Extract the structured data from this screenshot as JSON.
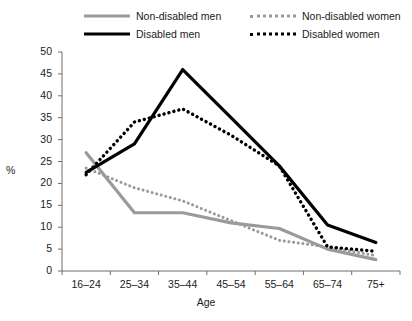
{
  "chart_data": {
    "type": "line",
    "title": "",
    "xlabel": "Age",
    "ylabel": "%",
    "categories": [
      "16–24",
      "25–34",
      "35–44",
      "45–54",
      "55–64",
      "65–74",
      "75+"
    ],
    "ylim": [
      0,
      50
    ],
    "ytick_values": [
      0,
      5,
      10,
      15,
      20,
      25,
      30,
      35,
      40,
      45,
      50
    ],
    "ytick_labels": [
      "0",
      "5",
      "10",
      "15",
      "20",
      "25",
      "30",
      "35",
      "40",
      "45",
      "50"
    ],
    "grid": false,
    "legend_position": "top",
    "series": [
      {
        "name": "Non-disabled men",
        "color": "#9a9a9a",
        "style": "solid",
        "values": [
          27.0,
          13.3,
          13.3,
          11.0,
          9.7,
          5.0,
          2.6
        ]
      },
      {
        "name": "Disabled men",
        "color": "#000000",
        "style": "solid",
        "values": [
          22.5,
          29.0,
          46.0,
          35.0,
          24.0,
          10.5,
          6.5
        ]
      },
      {
        "name": "Non-disabled women",
        "color": "#9a9a9a",
        "style": "dotted",
        "values": [
          23.5,
          19.0,
          16.0,
          11.5,
          7.0,
          5.5,
          3.5
        ]
      },
      {
        "name": "Disabled women",
        "color": "#000000",
        "style": "dotted",
        "values": [
          22.0,
          34.0,
          37.0,
          31.0,
          24.0,
          5.5,
          4.5
        ]
      }
    ]
  },
  "legend": {
    "entries": [
      {
        "label": "Non-disabled men",
        "swatch": "solid-gray",
        "row": 0,
        "col": 0
      },
      {
        "label": "Non-disabled women",
        "swatch": "dot-gray",
        "row": 0,
        "col": 1
      },
      {
        "label": "Disabled men",
        "swatch": "solid-black",
        "row": 1,
        "col": 0
      },
      {
        "label": "Disabled women",
        "swatch": "dot-black",
        "row": 1,
        "col": 1
      }
    ]
  },
  "axes": {
    "x_title": "Age",
    "y_title": "%"
  }
}
